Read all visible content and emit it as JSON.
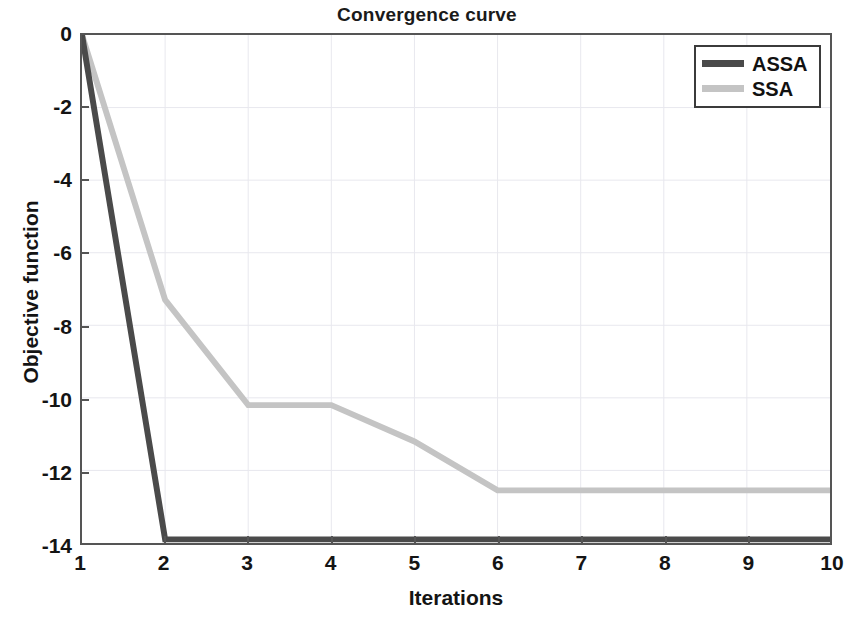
{
  "chart_data": {
    "type": "line",
    "title": "Convergence curve",
    "xlabel": "Iterations",
    "ylabel": "Objective function",
    "x": [
      1,
      2,
      3,
      4,
      5,
      6,
      7,
      8,
      9,
      10
    ],
    "xticklabels": [
      "1",
      "2",
      "3",
      "4",
      "5",
      "6",
      "7",
      "8",
      "9",
      "10"
    ],
    "yticks": [
      0,
      -2,
      -4,
      -6,
      -8,
      -10,
      -12,
      -14
    ],
    "yticklabels": [
      "0",
      "-2",
      "-4",
      "-6",
      "-8",
      "-10",
      "-12",
      "-14"
    ],
    "xlim": [
      1,
      10
    ],
    "ylim": [
      -14,
      0
    ],
    "grid": true,
    "legend_position": "top-right",
    "series": [
      {
        "name": "ASSA",
        "color": "#4a4a4a",
        "linewidth": 6,
        "values": [
          0,
          -13.9,
          -13.9,
          -13.9,
          -13.9,
          -13.9,
          -13.9,
          -13.9,
          -13.9,
          -13.9
        ]
      },
      {
        "name": "SSA",
        "color": "#c4c4c4",
        "linewidth": 6,
        "values": [
          0,
          -7.3,
          -10.2,
          -10.2,
          -11.2,
          -12.55,
          -12.55,
          -12.55,
          -12.55,
          -12.55
        ]
      }
    ]
  },
  "legend": {
    "entries": [
      {
        "label": "ASSA",
        "color": "#4a4a4a"
      },
      {
        "label": "SSA",
        "color": "#c4c4c4"
      }
    ]
  },
  "colors": {
    "assa": "#4a4a4a",
    "ssa": "#c4c4c4",
    "axis": "#555555",
    "grid": "#e8e8ee",
    "text": "#141414",
    "background": "#ffffff"
  }
}
